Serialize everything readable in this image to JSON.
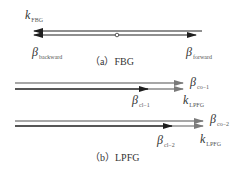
{
  "panel_a": {
    "caption": "（a）FBG",
    "labels": {
      "k_fbg": {
        "sym": "k",
        "sub": "FBG"
      },
      "beta_backward": {
        "sym": "β",
        "sub": "backward"
      },
      "beta_forward": {
        "sym": "β",
        "sub": "forward"
      }
    }
  },
  "panel_b": {
    "caption": "（b）LPFG",
    "labels": {
      "beta_co1": {
        "sym": "β",
        "sub": "co−1"
      },
      "beta_cl1": {
        "sym": "β",
        "sub": "cl−1"
      },
      "k_lpfg1": {
        "sym": "k",
        "sub": "LPFG"
      },
      "beta_co2": {
        "sym": "β",
        "sub": "co−2"
      },
      "beta_cl2": {
        "sym": "β",
        "sub": "cl−2"
      },
      "k_lpfg2": {
        "sym": "k",
        "sub": "LPFG"
      }
    }
  },
  "colors": {
    "gray_line": "#8a8a8a",
    "dark_line": "#1e1e1e"
  }
}
